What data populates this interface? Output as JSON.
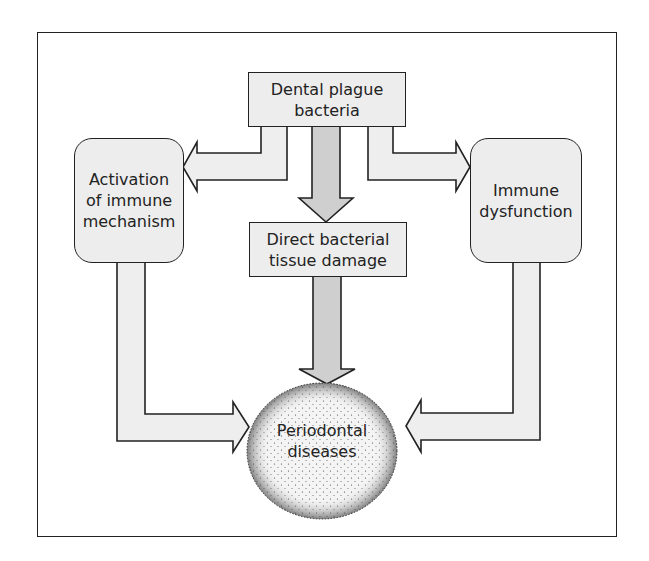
{
  "diagram": {
    "nodes": {
      "source": {
        "label": "Dental plague\nbacteria"
      },
      "immune_activation": {
        "label": "Activation\nof immune\nmechanism"
      },
      "direct_damage": {
        "label": "Direct bacterial\ntissue damage"
      },
      "immune_dysfunction": {
        "label": "Immune\ndysfunction"
      },
      "outcome": {
        "label": "Periodontal\ndiseases"
      }
    },
    "edges": [
      {
        "from": "source",
        "to": "immune_activation"
      },
      {
        "from": "source",
        "to": "direct_damage"
      },
      {
        "from": "source",
        "to": "immune_dysfunction"
      },
      {
        "from": "immune_activation",
        "to": "outcome"
      },
      {
        "from": "direct_damage",
        "to": "outcome"
      },
      {
        "from": "immune_dysfunction",
        "to": "outcome"
      }
    ],
    "colors": {
      "box_fill": "#ededed",
      "side_arrow_fill": "#eeeeee",
      "center_arrow_fill": "#cfcfcf",
      "stroke": "#222222"
    }
  }
}
